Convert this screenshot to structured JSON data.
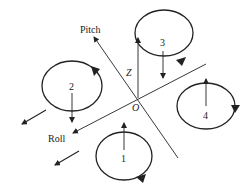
{
  "diagram": {
    "axes": {
      "pitch": {
        "label": "Pitch"
      },
      "roll": {
        "label": "Roll"
      },
      "z": {
        "label": "Z"
      },
      "origin": {
        "label": "O"
      }
    },
    "rotors": [
      {
        "id": 1,
        "label": "1",
        "thrust": "up",
        "rotation": "clockwise"
      },
      {
        "id": 2,
        "label": "2",
        "thrust": "down",
        "rotation": "clockwise"
      },
      {
        "id": 3,
        "label": "3",
        "thrust": "down",
        "rotation": "counterclockwise"
      },
      {
        "id": 4,
        "label": "4",
        "thrust": "up",
        "rotation": "clockwise"
      }
    ],
    "line_color": "#222222",
    "background": "#ffffff"
  }
}
